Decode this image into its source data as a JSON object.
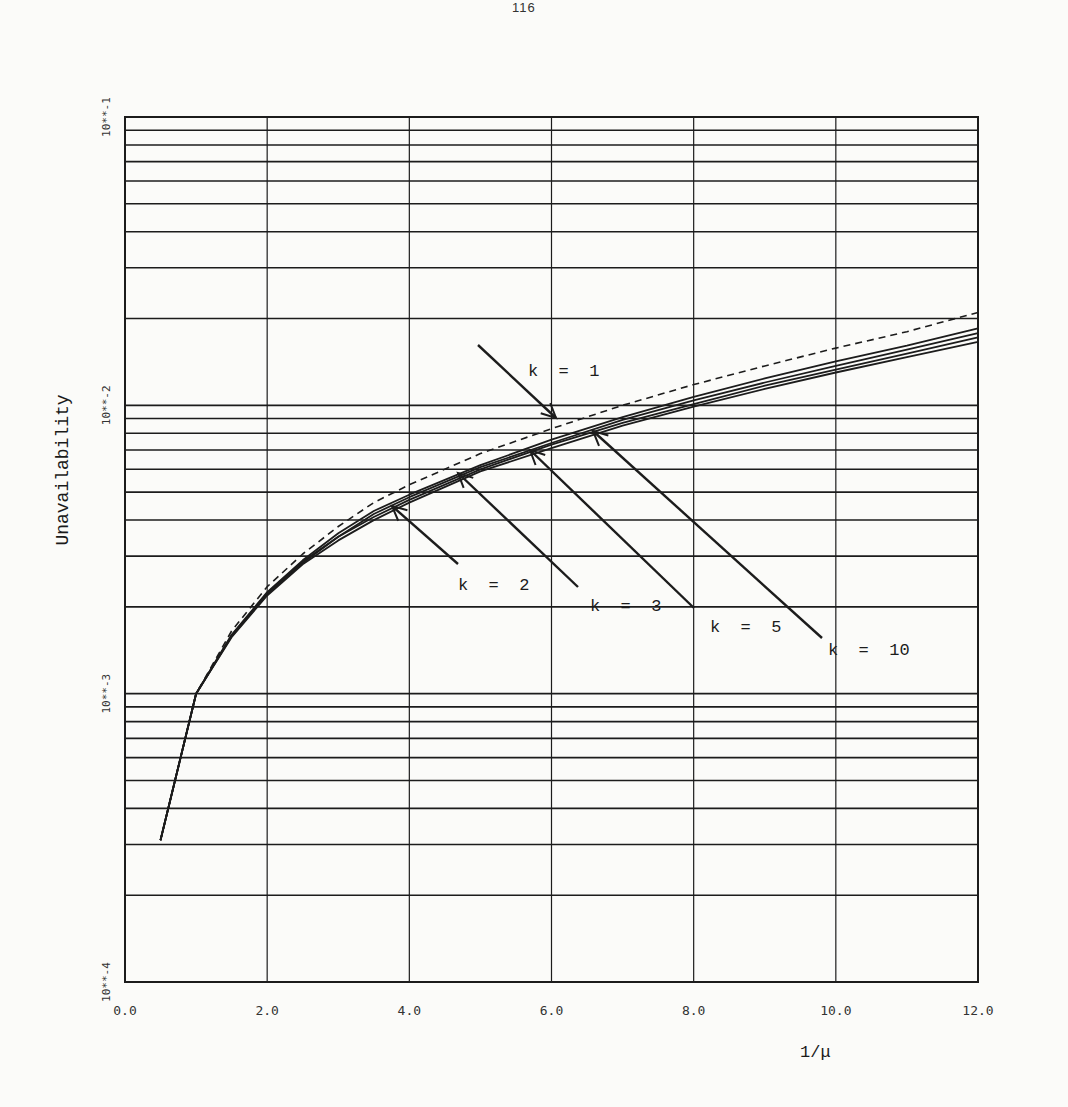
{
  "page": {
    "number": "116"
  },
  "chart_data": {
    "type": "line",
    "title": "",
    "xlabel": "1/μ",
    "ylabel": "Unavailability",
    "xlim": [
      0,
      12
    ],
    "ylim": [
      0.0001,
      0.1
    ],
    "yscale": "log",
    "grid": true,
    "x_ticks": [
      "0.0",
      "2.0",
      "4.0",
      "6.0",
      "8.0",
      "10.0",
      "12.0"
    ],
    "y_ticks": [
      "10**-4",
      "10**-3",
      "10**-2",
      "10**-1"
    ],
    "x": [
      0.5,
      1.0,
      1.5,
      2.0,
      2.5,
      3.0,
      3.5,
      4.0,
      5.0,
      6.0,
      7.0,
      8.0,
      9.0,
      10.0,
      11.0,
      12.0
    ],
    "series": [
      {
        "name": "k = 1",
        "style": "dashed",
        "values": [
          0.00031,
          0.001,
          0.00165,
          0.00235,
          0.00305,
          0.0038,
          0.0046,
          0.0053,
          0.0068,
          0.0083,
          0.01,
          0.0118,
          0.0137,
          0.0158,
          0.018,
          0.021
        ]
      },
      {
        "name": "k = 2",
        "style": "solid",
        "values": [
          0.00031,
          0.001,
          0.0016,
          0.00225,
          0.0029,
          0.0036,
          0.0043,
          0.0049,
          0.0062,
          0.0076,
          0.0091,
          0.0107,
          0.0124,
          0.0142,
          0.0161,
          0.0185
        ]
      },
      {
        "name": "k = 3",
        "style": "solid",
        "values": [
          0.00031,
          0.001,
          0.00159,
          0.00223,
          0.00287,
          0.0035,
          0.0042,
          0.0048,
          0.0061,
          0.0074,
          0.0089,
          0.0104,
          0.012,
          0.0137,
          0.0156,
          0.0178
        ]
      },
      {
        "name": "k = 5",
        "style": "solid",
        "values": [
          0.00031,
          0.001,
          0.00158,
          0.00221,
          0.00284,
          0.0035,
          0.0041,
          0.0047,
          0.006,
          0.0073,
          0.0087,
          0.0101,
          0.0117,
          0.0133,
          0.0151,
          0.0172
        ]
      },
      {
        "name": "k = 10",
        "style": "solid",
        "values": [
          0.00031,
          0.001,
          0.00157,
          0.00219,
          0.00281,
          0.0034,
          0.004,
          0.0046,
          0.0059,
          0.0071,
          0.0085,
          0.0099,
          0.0114,
          0.013,
          0.0147,
          0.0166
        ]
      }
    ],
    "annotations": [
      {
        "label": "k = 1",
        "text_x": 528,
        "text_y": 376,
        "arrow_from": [
          478,
          345
        ],
        "arrow_to": [
          556,
          418
        ]
      },
      {
        "label": "k = 2",
        "text_x": 458,
        "text_y": 590,
        "arrow_from": [
          458,
          564
        ],
        "arrow_to": [
          392,
          506
        ]
      },
      {
        "label": "k = 3",
        "text_x": 590,
        "text_y": 611,
        "arrow_from": [
          578,
          587
        ],
        "arrow_to": [
          458,
          473
        ]
      },
      {
        "label": "k = 5",
        "text_x": 710,
        "text_y": 632,
        "arrow_from": [
          694,
          608
        ],
        "arrow_to": [
          530,
          450
        ]
      },
      {
        "label": "k = 10",
        "text_x": 828,
        "text_y": 655,
        "arrow_from": [
          822,
          638
        ],
        "arrow_to": [
          593,
          431
        ]
      }
    ]
  }
}
